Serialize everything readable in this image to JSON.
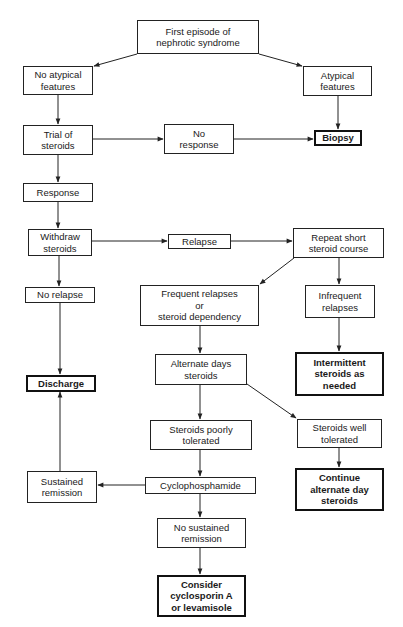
{
  "diagram": {
    "type": "flowchart",
    "topic": "Management of first episode of nephrotic syndrome",
    "nodes": {
      "first_episode": {
        "label": "First episode of\nnephrotic syndrome",
        "terminal": false
      },
      "no_atypical": {
        "label": "No atypical\nfeatures",
        "terminal": false
      },
      "atypical": {
        "label": "Atypical\nfeatures",
        "terminal": false
      },
      "trial_steroids": {
        "label": "Trial of\nsteroids",
        "terminal": false
      },
      "no_response": {
        "label": "No\nresponse",
        "terminal": false
      },
      "biopsy": {
        "label": "Biopsy",
        "terminal": true
      },
      "response": {
        "label": "Response",
        "terminal": false
      },
      "withdraw_steroids": {
        "label": "Withdraw\nsteroids",
        "terminal": false
      },
      "relapse": {
        "label": "Relapse",
        "terminal": false
      },
      "repeat_course": {
        "label": "Repeat short\nsteroid course",
        "terminal": false
      },
      "no_relapse": {
        "label": "No relapse",
        "terminal": false
      },
      "frequent_relapses": {
        "label": "Frequent relapses\nor\nsteroid dependency",
        "terminal": false
      },
      "infrequent_relapses": {
        "label": "Infrequent\nrelapses",
        "terminal": false
      },
      "discharge": {
        "label": "Discharge",
        "terminal": true
      },
      "alternate_days": {
        "label": "Alternate days\nsteroids",
        "terminal": false
      },
      "intermittent_steroids": {
        "label": "Intermittent\nsteroids as\nneeded",
        "terminal": true
      },
      "poorly_tolerated": {
        "label": "Steroids poorly\ntolerated",
        "terminal": false
      },
      "well_tolerated": {
        "label": "Steroids well\ntolerated",
        "terminal": false
      },
      "sustained_remission": {
        "label": "Sustained\nremission",
        "terminal": false
      },
      "cyclophosphamide": {
        "label": "Cyclophosphamide",
        "terminal": false
      },
      "continue_alternate": {
        "label": "Continue\nalternate day\nsteroids",
        "terminal": true
      },
      "no_sustained_remission": {
        "label": "No sustained\nremission",
        "terminal": false
      },
      "consider_cyclosporin": {
        "label": "Consider\ncyclosporin A\nor levamisole",
        "terminal": true
      }
    },
    "edges": [
      {
        "from": "first_episode",
        "to": "no_atypical"
      },
      {
        "from": "first_episode",
        "to": "atypical"
      },
      {
        "from": "no_atypical",
        "to": "trial_steroids"
      },
      {
        "from": "atypical",
        "to": "biopsy"
      },
      {
        "from": "trial_steroids",
        "to": "no_response"
      },
      {
        "from": "no_response",
        "to": "biopsy"
      },
      {
        "from": "trial_steroids",
        "to": "response"
      },
      {
        "from": "response",
        "to": "withdraw_steroids"
      },
      {
        "from": "withdraw_steroids",
        "to": "relapse"
      },
      {
        "from": "relapse",
        "to": "repeat_course"
      },
      {
        "from": "withdraw_steroids",
        "to": "no_relapse"
      },
      {
        "from": "repeat_course",
        "to": "frequent_relapses"
      },
      {
        "from": "repeat_course",
        "to": "infrequent_relapses"
      },
      {
        "from": "no_relapse",
        "to": "discharge"
      },
      {
        "from": "infrequent_relapses",
        "to": "intermittent_steroids"
      },
      {
        "from": "frequent_relapses",
        "to": "alternate_days"
      },
      {
        "from": "alternate_days",
        "to": "poorly_tolerated"
      },
      {
        "from": "alternate_days",
        "to": "well_tolerated"
      },
      {
        "from": "poorly_tolerated",
        "to": "cyclophosphamide"
      },
      {
        "from": "well_tolerated",
        "to": "continue_alternate"
      },
      {
        "from": "cyclophosphamide",
        "to": "sustained_remission"
      },
      {
        "from": "sustained_remission",
        "to": "discharge"
      },
      {
        "from": "cyclophosphamide",
        "to": "no_sustained_remission"
      },
      {
        "from": "no_sustained_remission",
        "to": "consider_cyclosporin"
      }
    ]
  },
  "colors": {
    "line": "#222222",
    "background": "#ffffff",
    "text": "#1a1a1a"
  }
}
